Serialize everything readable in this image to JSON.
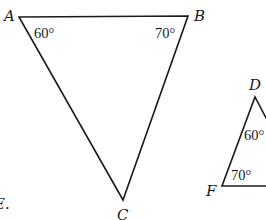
{
  "figure": {
    "triangle_abc": {
      "vertices": {
        "A": "A",
        "B": "B",
        "C": "C"
      },
      "angles": {
        "A": "60°",
        "B": "70°"
      }
    },
    "triangle_def": {
      "vertices": {
        "D": "D",
        "F": "F"
      },
      "angles": {
        "D": "60°",
        "F": "70°"
      }
    },
    "cropped_text": "E."
  }
}
